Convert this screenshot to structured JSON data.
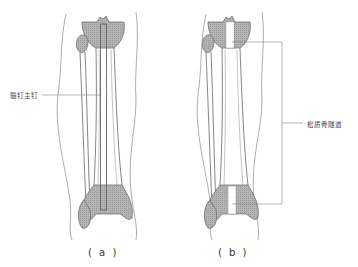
{
  "figure": {
    "panels": [
      {
        "id": "a",
        "caption": "( a )",
        "callout_label": "髓钉主钉"
      },
      {
        "id": "b",
        "caption": "( b )",
        "callout_label": "松质骨隧道"
      }
    ]
  },
  "colors": {
    "outline": "#777777",
    "bone_fill": "#a8a8a8",
    "leader_line": "#888888",
    "background": "#ffffff"
  }
}
